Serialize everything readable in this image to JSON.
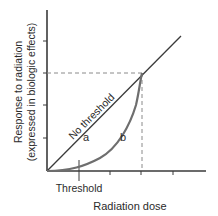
{
  "diagram": {
    "y_axis_label_line1": "Response to radiation",
    "y_axis_label_line2": "(expressed in biologic effects)",
    "x_axis_label": "Radiation dose",
    "threshold_label": "Threshold",
    "no_threshold_label": "No threshold",
    "curve_a_label": "a",
    "curve_b_label": "b",
    "colors": {
      "axis": "#3a3a3a",
      "line_a": "#3a3a3a",
      "curve_b": "#6e6e6e",
      "dashed": "#8a8a8a",
      "text": "#2b2b2b"
    }
  }
}
